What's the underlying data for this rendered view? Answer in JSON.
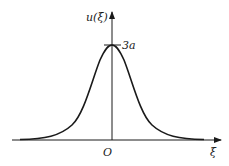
{
  "figure": {
    "y_axis_label": "u(ξ)",
    "x_axis_label": "ξ",
    "origin_label": "O",
    "peak_label": "3a",
    "curve": "bell-shaped (sech²-like) pulse centered at origin",
    "colors": {
      "stroke": "#1a1a1a",
      "background": "#ffffff"
    }
  }
}
